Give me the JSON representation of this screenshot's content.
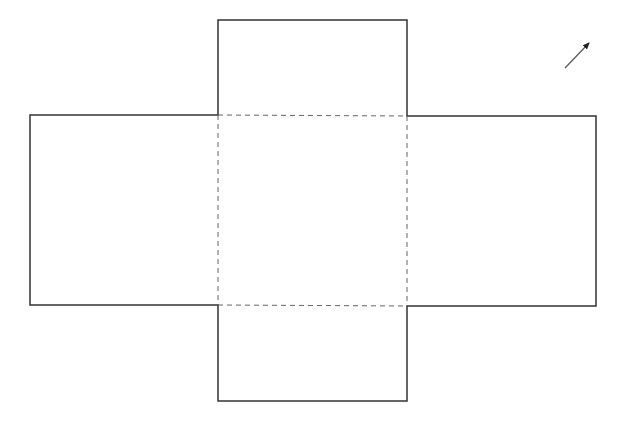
{
  "diagram": {
    "type": "cube-net-cross",
    "stroke_color": "#333333",
    "dash_color": "#555555",
    "background": "#ffffff",
    "faces": {
      "top": {
        "x": 218,
        "y": 20,
        "w": 189,
        "h": 95
      },
      "left": {
        "x": 30,
        "y": 115,
        "w": 188,
        "h": 190
      },
      "center": {
        "x": 218,
        "y": 115,
        "w": 189,
        "h": 191
      },
      "right": {
        "x": 407,
        "y": 116,
        "w": 189,
        "h": 190
      },
      "bottom": {
        "x": 218,
        "y": 306,
        "w": 189,
        "h": 95
      }
    },
    "arrow": {
      "x1": 565,
      "y1": 68,
      "x2": 589,
      "y2": 43,
      "icon": "arrow-up-right-icon"
    }
  }
}
